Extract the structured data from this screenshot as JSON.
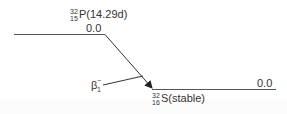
{
  "diagram": {
    "type": "nuclear-decay-scheme",
    "parent": {
      "mass_number": "32",
      "atomic_number": "15",
      "symbol": "P",
      "half_life": "(14.29d)",
      "level_energy": "0.0"
    },
    "daughter": {
      "mass_number": "32",
      "atomic_number": "16",
      "symbol": "S",
      "half_life": "(stable)",
      "level_energy": "0.0"
    },
    "transition": {
      "label": "β",
      "superscript": "−",
      "subscript": "1"
    },
    "colors": {
      "line": "#333333",
      "text": "#333333",
      "background": "#ffffff"
    }
  }
}
